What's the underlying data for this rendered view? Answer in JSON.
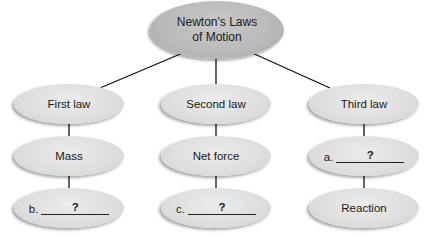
{
  "diagram": {
    "title": "Newton's Laws of Motion",
    "root": {
      "label_line1": "Newton's Laws",
      "label_line2": "of Motion"
    },
    "branches": [
      {
        "label": "First law",
        "children": [
          {
            "type": "text",
            "label": "Mass"
          },
          {
            "type": "blank",
            "prefix": "b.",
            "value": "?"
          }
        ]
      },
      {
        "label": "Second law",
        "children": [
          {
            "type": "text",
            "label": "Net force"
          },
          {
            "type": "blank",
            "prefix": "c.",
            "value": "?"
          }
        ]
      },
      {
        "label": "Third law",
        "children": [
          {
            "type": "blank",
            "prefix": "a.",
            "value": "?"
          },
          {
            "type": "text",
            "label": "Reaction"
          }
        ]
      }
    ],
    "colors": {
      "root_fill": "#b9b9b9",
      "node_fill": "#dedede",
      "connector": "#111111",
      "background": "#ffffff"
    }
  }
}
